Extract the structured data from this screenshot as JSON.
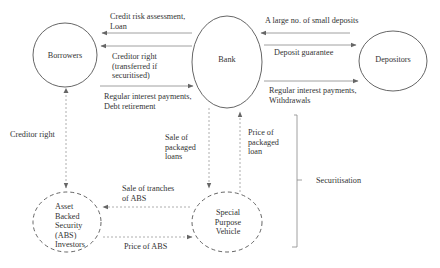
{
  "diagram": {
    "nodes": {
      "borrowers": {
        "label": "Borrowers"
      },
      "bank": {
        "label": "Bank"
      },
      "depositors": {
        "label": "Depositors"
      },
      "abs_investors": {
        "label": "Asset\nBacked\nSecurity\n(ABS)\nInvestors"
      },
      "spv": {
        "label": "Special\nPurpose\nVehicle"
      }
    },
    "edges": {
      "bank_to_borrowers_loan": {
        "label": "Credit risk assessment,\nLoan"
      },
      "borrowers_to_bank_creditor_right": {
        "label": "Creditor right\n(transferred if\nsecuritised)"
      },
      "borrowers_to_bank_payments": {
        "label": "Regular interest payments,\nDebt retirement"
      },
      "depositors_to_bank_deposits": {
        "label": "A large no. of small deposits"
      },
      "bank_to_depositors_guarantee": {
        "label": "Deposit guarantee"
      },
      "bank_to_depositors_payments": {
        "label": "Regular interest payments,\nWithdrawals"
      },
      "borrowers_abs_creditor_right": {
        "label": "Creditor right"
      },
      "bank_to_spv_sale": {
        "label": "Sale of\npackaged\nloans"
      },
      "spv_to_bank_price": {
        "label": "Price of\npackaged\nloan"
      },
      "spv_to_abs_tranches": {
        "label": "Sale of tranches\nof ABS"
      },
      "abs_to_spv_price": {
        "label": "Price of ABS"
      }
    },
    "brace": {
      "label": "Securitisation"
    },
    "colors": {
      "line": "#555555",
      "dashed": "#888888",
      "text": "#333333"
    }
  }
}
